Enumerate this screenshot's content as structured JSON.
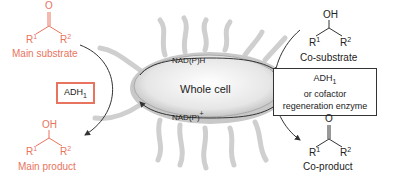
{
  "left": {
    "main_substrate": {
      "functional_group": "O",
      "r1": "R",
      "r1_sup": "1",
      "r2": "R",
      "r2_sup": "2",
      "label": "Main substrate"
    },
    "enzyme": {
      "label": "ADH",
      "sub": "1"
    },
    "main_product": {
      "functional_group": "OH",
      "r1": "R",
      "r1_sup": "1",
      "r2": "R",
      "r2_sup": "2",
      "label": "Main product"
    }
  },
  "center": {
    "cell_label": "Whole cell",
    "cofactor_top": "NAD(P)H",
    "cofactor_bottom_base": "NAD(P)",
    "cofactor_bottom_sup": "+"
  },
  "right": {
    "co_substrate": {
      "functional_group": "OH",
      "r1": "R",
      "r1_sup": "1",
      "r2": "R",
      "r2_sup": "2",
      "label": "Co-substrate"
    },
    "enzyme": {
      "line1": "ADH",
      "line1_sub": "1",
      "line2": "or cofactor",
      "line3": "regeneration enzyme"
    },
    "co_product": {
      "functional_group": "O",
      "r1": "R",
      "r1_sup": "1",
      "r2": "R",
      "r2_sup": "2",
      "label": "Co-product"
    }
  },
  "colors": {
    "accent": "#e8735e",
    "text": "#222222",
    "cell": "#d8d8d8"
  }
}
